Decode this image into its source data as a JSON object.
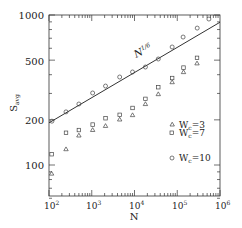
{
  "chart_data": {
    "type": "scatter",
    "title": "",
    "xlabel": "N",
    "ylabel": "S_avg",
    "xscale": "log",
    "yscale": "log",
    "xlim": [
      100,
      1000000
    ],
    "ylim": [
      60,
      1000
    ],
    "x_ticks": [
      "10^2",
      "10^3",
      "10^4",
      "10^5",
      "10^6"
    ],
    "y_ticks": [
      "100",
      "200",
      "500",
      "1000"
    ],
    "grid": false,
    "legend_position": "lower right inside",
    "annotations": [
      {
        "text": "N^1/6",
        "position": "along line, upper middle"
      }
    ],
    "fit_line": {
      "label": "N^1/6",
      "x": [
        80,
        1000000
      ],
      "y": [
        184,
        895
      ]
    },
    "series": [
      {
        "name": "Wc=3",
        "marker": "triangle",
        "x": [
          115,
          250,
          500,
          1050,
          2100,
          4500,
          9000,
          18000,
          36000,
          76000,
          140000,
          290000
        ],
        "y": [
          88,
          128,
          158,
          172,
          183,
          202,
          216,
          256,
          298,
          358,
          418,
          478
        ]
      },
      {
        "name": "Wc=7",
        "marker": "square",
        "x": [
          115,
          250,
          500,
          1050,
          2100,
          4500,
          9000,
          18000,
          36000,
          76000,
          140000,
          290000
        ],
        "y": [
          118,
          164,
          171,
          186,
          205,
          216,
          240,
          276,
          330,
          380,
          446,
          518
        ]
      },
      {
        "name": "Wc=10",
        "marker": "circle",
        "x": [
          117,
          250,
          500,
          1050,
          2100,
          4500,
          9000,
          18000,
          36000,
          76000,
          137000,
          293000,
          550000
        ],
        "y": [
          196,
          226,
          255,
          302,
          336,
          386,
          417,
          450,
          509,
          612,
          713,
          818,
          940
        ]
      }
    ]
  },
  "labels": {
    "ylabel": "S",
    "ylabel_sub": "avg",
    "xlabel": "N",
    "fit": "N",
    "fit_exp": "1/6",
    "y_ticks": [
      "1000",
      "500",
      "200",
      "100"
    ],
    "x_base": "10",
    "x_exps": [
      "2",
      "3",
      "4",
      "5",
      "6"
    ],
    "legend": [
      {
        "prefix": "W",
        "sub": "c",
        "value": "=3"
      },
      {
        "prefix": "W",
        "sub": "c",
        "value": "=7"
      },
      {
        "prefix": "W",
        "sub": "c",
        "value": "=10"
      }
    ]
  }
}
